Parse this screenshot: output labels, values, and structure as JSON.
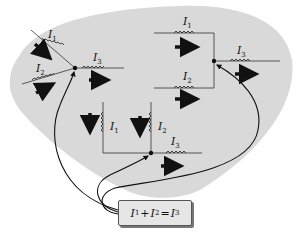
{
  "figure": {
    "topic": "Kirchhoff junction rule",
    "background_color": "#d9d9d9",
    "wire_color": "#222222",
    "arrow_color": "#111111"
  },
  "junctions": [
    {
      "id": "junction-left",
      "labels": {
        "in1": "I",
        "in1_sub": "1",
        "in2": "I",
        "in2_sub": "2",
        "out": "I",
        "out_sub": "3"
      }
    },
    {
      "id": "junction-right",
      "labels": {
        "in1": "I",
        "in1_sub": "1",
        "in2": "I",
        "in2_sub": "2",
        "out": "I",
        "out_sub": "3"
      }
    },
    {
      "id": "junction-middle",
      "labels": {
        "in1": "I",
        "in1_sub": "1",
        "in2": "I",
        "in2_sub": "2",
        "out": "I",
        "out_sub": "3"
      }
    }
  ],
  "equation": {
    "term1": "I",
    "term1_sub": "1",
    "plus": "+",
    "term2": "I",
    "term2_sub": "2",
    "equals": "=",
    "result": "I",
    "result_sub": "3"
  }
}
